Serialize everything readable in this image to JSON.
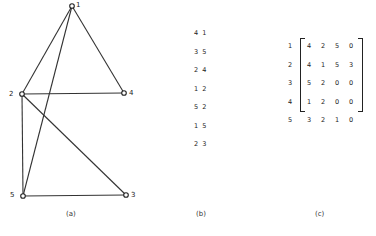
{
  "panel_a": {
    "caption": "(a)",
    "nodes": [
      {
        "id": "1",
        "x": 72,
        "y": 6
      },
      {
        "id": "2",
        "x": 22,
        "y": 94
      },
      {
        "id": "3",
        "x": 126,
        "y": 195
      },
      {
        "id": "4",
        "x": 124,
        "y": 93
      },
      {
        "id": "5",
        "x": 23,
        "y": 196
      }
    ],
    "edges": [
      [
        "1",
        "2"
      ],
      [
        "1",
        "4"
      ],
      [
        "1",
        "5"
      ],
      [
        "2",
        "4"
      ],
      [
        "2",
        "5"
      ],
      [
        "2",
        "3"
      ],
      [
        "5",
        "3"
      ]
    ]
  },
  "panel_b": {
    "caption": "(b)",
    "pairs": [
      "4 1",
      "3 5",
      "2 4",
      "1 2",
      "5 2",
      "1 5",
      "2 3"
    ]
  },
  "panel_c": {
    "caption": "(c)",
    "row_labels": [
      "1",
      "2",
      "3",
      "4",
      "5"
    ],
    "matrix": [
      [
        "4",
        "2",
        "5",
        "0"
      ],
      [
        "4",
        "1",
        "5",
        "3"
      ],
      [
        "5",
        "2",
        "0",
        "0"
      ],
      [
        "1",
        "2",
        "0",
        "0"
      ],
      [
        "3",
        "2",
        "1",
        "0"
      ]
    ]
  }
}
